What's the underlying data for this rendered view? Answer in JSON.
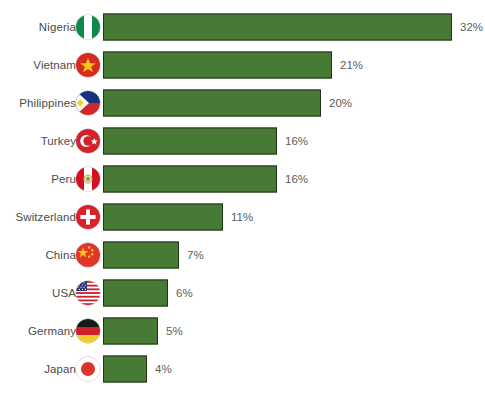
{
  "chart_data": {
    "type": "bar",
    "orientation": "horizontal",
    "title": "",
    "xlabel": "",
    "ylabel": "",
    "grid": false,
    "legend": null,
    "value_suffix": "%",
    "categories": [
      "Nigeria",
      "Vietnam",
      "Philippines",
      "Turkey",
      "Peru",
      "Switzerland",
      "China",
      "USA",
      "Germany",
      "Japan"
    ],
    "values": [
      32,
      21,
      20,
      16,
      16,
      11,
      7,
      6,
      5,
      4
    ],
    "value_labels": [
      "32%",
      "21%",
      "20%",
      "16%",
      "16%",
      "11%",
      "7%",
      "6%",
      "5%",
      "4%"
    ],
    "xlim": [
      0,
      32
    ],
    "bar_color": "#477b35",
    "bar_border_color": "#23331a",
    "label_color": "#4b4b4b",
    "value_color": "#5d5d5d",
    "background": "#ffffff"
  },
  "partial_top_text": "",
  "rows": [
    {
      "country": "Nigeria",
      "value": 32,
      "value_label": "32%",
      "flag": "flag-nigeria"
    },
    {
      "country": "Vietnam",
      "value": 21,
      "value_label": "21%",
      "flag": "flag-vietnam"
    },
    {
      "country": "Philippines",
      "value": 20,
      "value_label": "20%",
      "flag": "flag-philippines"
    },
    {
      "country": "Turkey",
      "value": 16,
      "value_label": "16%",
      "flag": "flag-turkey"
    },
    {
      "country": "Peru",
      "value": 16,
      "value_label": "16%",
      "flag": "flag-peru"
    },
    {
      "country": "Switzerland",
      "value": 11,
      "value_label": "11%",
      "flag": "flag-switzerland"
    },
    {
      "country": "China",
      "value": 7,
      "value_label": "7%",
      "flag": "flag-china"
    },
    {
      "country": "USA",
      "value": 6,
      "value_label": "6%",
      "flag": "flag-usa"
    },
    {
      "country": "Germany",
      "value": 5,
      "value_label": "5%",
      "flag": "flag-germany"
    },
    {
      "country": "Japan",
      "value": 4,
      "value_label": "4%",
      "flag": "flag-japan"
    }
  ]
}
